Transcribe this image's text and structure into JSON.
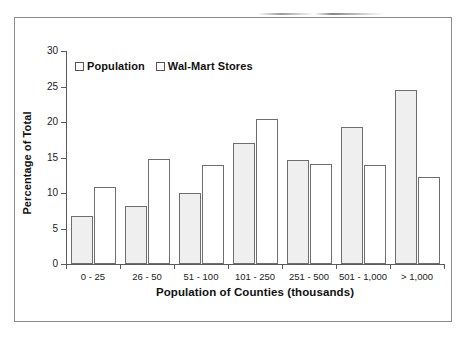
{
  "chart_data": {
    "type": "bar",
    "title": "",
    "xlabel": "Population of Counties (thousands)",
    "ylabel": "Percentage of Total",
    "categories": [
      "0 - 25",
      "26 - 50",
      "51 - 100",
      "101 - 250",
      "251 - 500",
      "501 - 1,000",
      "> 1,000"
    ],
    "series": [
      {
        "name": "Population",
        "values": [
          6.8,
          8.2,
          10.0,
          17.0,
          14.6,
          19.3,
          24.5
        ]
      },
      {
        "name": "Wal-Mart Stores",
        "values": [
          10.8,
          14.8,
          13.9,
          20.4,
          14.1,
          14.0,
          12.3
        ]
      }
    ],
    "ylim": [
      0,
      30
    ],
    "yticks": [
      0,
      5,
      10,
      15,
      20,
      25,
      30
    ],
    "ytick_labels": [
      "0",
      "5",
      "10",
      "15",
      "20",
      "25",
      "30"
    ],
    "grid": false,
    "legend_position": "top-left",
    "colors": {
      "population_fill": "#efefef",
      "stores_fill": "#ffffff",
      "bar_outline": "#6e6e6e",
      "axis": "#5a5a5a",
      "frame": "#8d8d8d",
      "text": "#111111"
    }
  },
  "legend": {
    "entries": [
      {
        "label": "Population",
        "swatch": "#efefef"
      },
      {
        "label": "Wal-Mart Stores",
        "swatch": "#ffffff"
      }
    ]
  }
}
